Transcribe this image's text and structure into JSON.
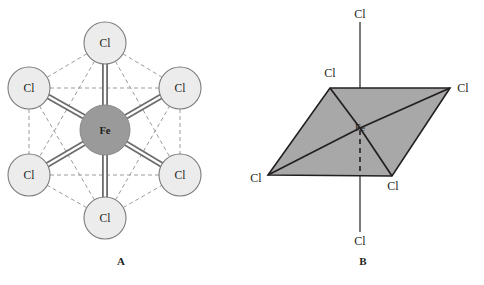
{
  "figure": {
    "background_color": "#ffffff",
    "panels": [
      {
        "id": "A",
        "caption": "A",
        "representation": "ball-and-stick octahedron wireframe",
        "center_atom": {
          "symbol": "Fe",
          "label": "Fe",
          "fill": "#9a9a9a",
          "stroke": "#6d6d6d",
          "cx": 105,
          "cy": 130,
          "r": 25
        },
        "ligands": [
          {
            "symbol": "Cl",
            "label": "Cl",
            "position": "top",
            "cx": 105,
            "cy": 43,
            "r": 21,
            "bond": "solid-double"
          },
          {
            "symbol": "Cl",
            "label": "Cl",
            "position": "upper-left",
            "cx": 29,
            "cy": 88,
            "r": 21,
            "bond": "solid-double"
          },
          {
            "symbol": "Cl",
            "label": "Cl",
            "position": "upper-right",
            "cx": 180,
            "cy": 88,
            "r": 21,
            "bond": "solid-double"
          },
          {
            "symbol": "Cl",
            "label": "Cl",
            "position": "lower-left",
            "cx": 29,
            "cy": 175,
            "r": 21,
            "bond": "solid-double"
          },
          {
            "symbol": "Cl",
            "label": "Cl",
            "position": "lower-right",
            "cx": 180,
            "cy": 175,
            "r": 21,
            "bond": "solid-double"
          },
          {
            "symbol": "Cl",
            "label": "Cl",
            "position": "bottom",
            "cx": 105,
            "cy": 218,
            "r": 21,
            "bond": "solid-double"
          }
        ],
        "ligand_style": {
          "fill": "#ececec",
          "stroke": "#7c7c7c"
        },
        "wireframe_style": {
          "stroke": "#9b9b9b",
          "dash": "4 3"
        },
        "bond_style": {
          "stroke": "#6d6d6d",
          "fill": "#ffffff"
        }
      },
      {
        "id": "B",
        "caption": "B",
        "representation": "shaded square-planar parallelogram with axial bonds",
        "center_atom": {
          "symbol": "Fe",
          "label": "Fe",
          "x": 360,
          "y": 128
        },
        "plane_fill": "#a8a8a8",
        "plane_stroke": "#231f20",
        "vertices": [
          {
            "symbol": "Cl",
            "label": "Cl",
            "position": "back-left",
            "x": 330,
            "y": 88,
            "label_x": 330,
            "label_y": 76
          },
          {
            "symbol": "Cl",
            "label": "Cl",
            "position": "back-right",
            "x": 450,
            "y": 88,
            "label_x": 464,
            "label_y": 90
          },
          {
            "symbol": "Cl",
            "label": "Cl",
            "position": "front-right",
            "x": 392,
            "y": 176,
            "label_x": 392,
            "label_y": 189
          },
          {
            "symbol": "Cl",
            "label": "Cl",
            "position": "front-left",
            "x": 268,
            "y": 175,
            "label_x": 256,
            "label_y": 178
          }
        ],
        "axial": [
          {
            "symbol": "Cl",
            "label": "Cl",
            "position": "axial-top",
            "x": 360,
            "y": 22,
            "label_x": 360,
            "label_y": 16,
            "line": "solid"
          },
          {
            "symbol": "Cl",
            "label": "Cl",
            "position": "axial-bottom",
            "x": 360,
            "y": 232,
            "label_x": 360,
            "label_y": 243,
            "line": "solid"
          }
        ],
        "hidden_segment_style": {
          "stroke": "#231f20",
          "dash": "5 4"
        }
      }
    ]
  }
}
